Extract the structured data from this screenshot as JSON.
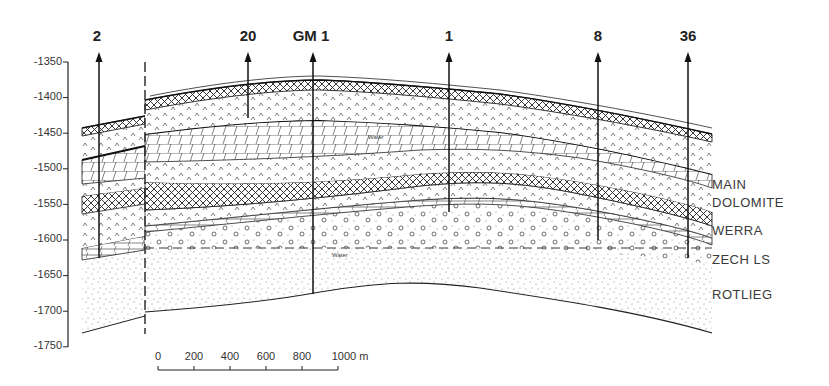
{
  "figure": {
    "type": "geological-cross-section",
    "wells": [
      {
        "id": "2",
        "label": "2",
        "x": 99
      },
      {
        "id": "20",
        "label": "20",
        "x": 248
      },
      {
        "id": "GM1",
        "label": "GM 1",
        "x": 313
      },
      {
        "id": "1",
        "label": "1",
        "x": 449
      },
      {
        "id": "8",
        "label": "8",
        "x": 598
      },
      {
        "id": "36",
        "label": "36",
        "x": 688
      }
    ],
    "y_axis": {
      "ticks": [
        "-1350",
        "-1400",
        "-1450",
        "-1500",
        "-1550",
        "-1600",
        "-1650",
        "-1700",
        "-1750"
      ],
      "values": [
        -1350,
        -1400,
        -1450,
        -1500,
        -1550,
        -1600,
        -1650,
        -1700,
        -1750
      ]
    },
    "units": [
      {
        "id": "main-dolomite-1",
        "label": "MAIN"
      },
      {
        "id": "main-dolomite-2",
        "label": "DOLOMITE"
      },
      {
        "id": "werra",
        "label": "WERRA"
      },
      {
        "id": "zech-ls",
        "label": "ZECH LS"
      },
      {
        "id": "rotlieg",
        "label": "ROTLIEG"
      }
    ],
    "annotations": {
      "water_upper": "Water",
      "water_lower": "Water"
    },
    "scale_bar": {
      "ticks": [
        "0",
        "200",
        "400",
        "600",
        "800",
        "1000 m"
      ],
      "unit": "m"
    }
  }
}
